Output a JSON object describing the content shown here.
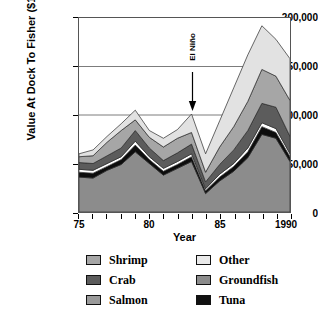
{
  "chart_data": {
    "type": "area",
    "stacked": true,
    "title": "",
    "xlabel": "Year",
    "ylabel": "Value At Dock To Fisher ($1,000)",
    "xlim": [
      75,
      90
    ],
    "ylim": [
      0,
      200000
    ],
    "xtick_labels": [
      "75",
      "80",
      "85",
      "1990"
    ],
    "xtick_values": [
      75,
      80,
      85,
      90
    ],
    "ytick_labels": [
      "0",
      "50,000",
      "100,000",
      "150,000",
      "200,000"
    ],
    "ytick_values": [
      0,
      50000,
      100000,
      150000,
      200000
    ],
    "grid": "horizontal",
    "legend_position": "below",
    "x": [
      75,
      76,
      77,
      78,
      79,
      80,
      81,
      82,
      83,
      84,
      85,
      86,
      87,
      88,
      89,
      90
    ],
    "series": [
      {
        "name": "Groundfish",
        "color": "#8c8c8c",
        "values": [
          36000,
          35000,
          43000,
          49000,
          62000,
          50000,
          38000,
          45000,
          52000,
          19000,
          32000,
          42000,
          56000,
          80000,
          76000,
          52000
        ]
      },
      {
        "name": "Tuna",
        "color": "#0d0d0d",
        "values": [
          5000,
          5000,
          4000,
          5000,
          7000,
          4000,
          4000,
          4000,
          5000,
          3000,
          4000,
          5000,
          6000,
          8000,
          6000,
          5000
        ]
      },
      {
        "name": "Salmon",
        "color": "#ffffff",
        "values": [
          3000,
          3000,
          3000,
          3000,
          4000,
          3000,
          3000,
          3000,
          3000,
          2000,
          3000,
          3000,
          4000,
          4000,
          4000,
          3000
        ]
      },
      {
        "name": "Crab",
        "color": "#5c5c5c",
        "values": [
          7000,
          7000,
          8000,
          9000,
          11000,
          9000,
          8000,
          9000,
          10000,
          7000,
          10000,
          14000,
          18000,
          20000,
          22000,
          18000
        ]
      },
      {
        "name": "Shrimp",
        "color": "#a6a6a6",
        "values": [
          6000,
          8000,
          14000,
          18000,
          11000,
          11000,
          14000,
          15000,
          12000,
          10000,
          18000,
          24000,
          30000,
          35000,
          32000,
          37000
        ]
      },
      {
        "name": "Other",
        "color": "#e2e2e2",
        "values": [
          3000,
          6000,
          6000,
          7000,
          10000,
          7000,
          9000,
          9000,
          19000,
          19000,
          27000,
          40000,
          48000,
          45000,
          38000,
          43000
        ]
      }
    ],
    "annotations": [
      {
        "name": "el-nino",
        "label": "El Niño",
        "x": 83,
        "y_tip": 100000,
        "y_text_top": 165000,
        "arrow": "down"
      }
    ]
  },
  "axis": {
    "y_title": "Value At Dock To Fisher ($1,000)",
    "x_title": "Year",
    "yticks": [
      {
        "label": "200,000"
      },
      {
        "label": "150,000"
      },
      {
        "label": "100,000"
      },
      {
        "label": "50,000"
      },
      {
        "label": "0"
      }
    ],
    "xticks": [
      {
        "label": "75"
      },
      {
        "label": "80"
      },
      {
        "label": "85"
      },
      {
        "label": "1990"
      }
    ]
  },
  "legend": {
    "rows": [
      [
        {
          "label": "Shrimp",
          "color": "#a6a6a6"
        },
        {
          "label": "Other",
          "color": "#e9e9e9"
        }
      ],
      [
        {
          "label": "Crab",
          "color": "#5c5c5c"
        },
        {
          "label": "Groundfish",
          "color": "#8c8c8c"
        }
      ],
      [
        {
          "label": "Salmon",
          "color": "#9a9a9a"
        },
        {
          "label": "Tuna",
          "color": "#111111"
        }
      ]
    ]
  },
  "annotation": {
    "el_nino_label": "El Niño"
  }
}
